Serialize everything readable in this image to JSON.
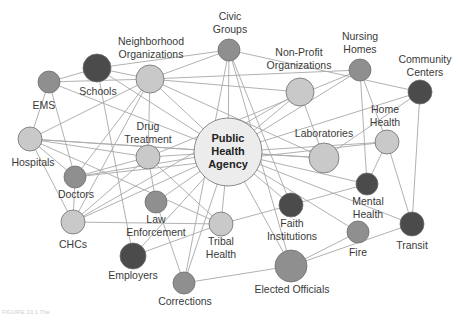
{
  "diagram": {
    "colors": {
      "dark": "#4b4b4b",
      "medium": "#8f8f8f",
      "light": "#c9c9c9",
      "center": "#ececec",
      "edge": "#a8a8a8"
    },
    "center": {
      "id": "pha",
      "lines": [
        "Public",
        "Health",
        "Agency"
      ]
    },
    "nodes": [
      {
        "id": "pha",
        "label": "Public Health Agency",
        "x": 228,
        "y": 152,
        "r": 34,
        "shade": "center"
      },
      {
        "id": "civic",
        "label": "Civic Groups",
        "lines": [
          "Civic",
          "Groups"
        ],
        "x": 229,
        "y": 50,
        "r": 11,
        "shade": "medium"
      },
      {
        "id": "neigh",
        "label": "Neighborhood Organizations",
        "lines": [
          "Neighborhood",
          "Organizations"
        ],
        "x": 150,
        "y": 79,
        "r": 14,
        "shade": "light"
      },
      {
        "id": "schools",
        "label": "Schools",
        "lines": [
          "Schools"
        ],
        "x": 97,
        "y": 68,
        "r": 14,
        "shade": "dark"
      },
      {
        "id": "ems",
        "label": "EMS",
        "lines": [
          "EMS"
        ],
        "x": 49,
        "y": 82,
        "r": 11,
        "shade": "medium"
      },
      {
        "id": "hospitals",
        "label": "Hospitals",
        "lines": [
          "Hospitals"
        ],
        "x": 30,
        "y": 139,
        "r": 12,
        "shade": "light"
      },
      {
        "id": "doctors",
        "label": "Doctors",
        "lines": [
          "Doctors"
        ],
        "x": 75,
        "y": 177,
        "r": 11,
        "shade": "medium"
      },
      {
        "id": "drug",
        "label": "Drug Treatment",
        "lines": [
          "Drug",
          "Treatment"
        ],
        "x": 148,
        "y": 157,
        "r": 12,
        "shade": "light"
      },
      {
        "id": "chcs",
        "label": "CHCs",
        "lines": [
          "CHCs"
        ],
        "x": 73,
        "y": 222,
        "r": 12,
        "shade": "light"
      },
      {
        "id": "law",
        "label": "Law Enforcement",
        "lines": [
          "Law",
          "Enforcement"
        ],
        "x": 156,
        "y": 202,
        "r": 11,
        "shade": "medium"
      },
      {
        "id": "employers",
        "label": "Employers",
        "lines": [
          "Employers"
        ],
        "x": 133,
        "y": 256,
        "r": 13,
        "shade": "dark"
      },
      {
        "id": "tribal",
        "label": "Tribal Health",
        "lines": [
          "Tribal",
          "Health"
        ],
        "x": 221,
        "y": 224,
        "r": 12,
        "shade": "light"
      },
      {
        "id": "corrections",
        "label": "Corrections",
        "lines": [
          "Corrections"
        ],
        "x": 184,
        "y": 283,
        "r": 11,
        "shade": "medium"
      },
      {
        "id": "elected",
        "label": "Elected Officials",
        "lines": [
          "Elected Officials"
        ],
        "x": 291,
        "y": 266,
        "r": 16,
        "shade": "medium"
      },
      {
        "id": "faith",
        "label": "Faith Institutions",
        "lines": [
          "Faith",
          "Institutions"
        ],
        "x": 291,
        "y": 205,
        "r": 12,
        "shade": "dark"
      },
      {
        "id": "fire",
        "label": "Fire",
        "lines": [
          "Fire"
        ],
        "x": 358,
        "y": 232,
        "r": 11,
        "shade": "medium"
      },
      {
        "id": "mental",
        "label": "Mental Health",
        "lines": [
          "Mental",
          "Health"
        ],
        "x": 367,
        "y": 184,
        "r": 11,
        "shade": "dark"
      },
      {
        "id": "transit",
        "label": "Transit",
        "lines": [
          "Transit"
        ],
        "x": 412,
        "y": 224,
        "r": 12,
        "shade": "dark"
      },
      {
        "id": "home",
        "label": "Home Health",
        "lines": [
          "Home",
          "Health"
        ],
        "x": 387,
        "y": 142,
        "r": 12,
        "shade": "light"
      },
      {
        "id": "community",
        "label": "Community Centers",
        "lines": [
          "Community",
          "Centers"
        ],
        "x": 420,
        "y": 92,
        "r": 12,
        "shade": "dark"
      },
      {
        "id": "nursing",
        "label": "Nursing Homes",
        "lines": [
          "Nursing",
          "Homes"
        ],
        "x": 360,
        "y": 70,
        "r": 11,
        "shade": "medium"
      },
      {
        "id": "nonprofit",
        "label": "Non-Profit Organizations",
        "lines": [
          "Non-Profit",
          "Organizations"
        ],
        "x": 300,
        "y": 92,
        "r": 14,
        "shade": "light"
      },
      {
        "id": "labs",
        "label": "Laboratories",
        "lines": [
          "Laboratories"
        ],
        "x": 324,
        "y": 158,
        "r": 15,
        "shade": "light"
      }
    ],
    "labels": [
      {
        "node": "civic",
        "lines": [
          "Civic",
          "Groups"
        ],
        "x": 230,
        "y": 20
      },
      {
        "node": "neigh",
        "lines": [
          "Neighborhood",
          "Organizations"
        ],
        "x": 151,
        "y": 45
      },
      {
        "node": "schools",
        "lines": [
          "Schools"
        ],
        "x": 98,
        "y": 95
      },
      {
        "node": "ems",
        "lines": [
          "EMS"
        ],
        "x": 44,
        "y": 109
      },
      {
        "node": "hospitals",
        "lines": [
          "Hospitals"
        ],
        "x": 33,
        "y": 166
      },
      {
        "node": "doctors",
        "lines": [
          "Doctors"
        ],
        "x": 76,
        "y": 198
      },
      {
        "node": "drug",
        "lines": [
          "Drug",
          "Treatment"
        ],
        "x": 148,
        "y": 130
      },
      {
        "node": "chcs",
        "lines": [
          "CHCs"
        ],
        "x": 73,
        "y": 248
      },
      {
        "node": "law",
        "lines": [
          "Law",
          "Enforcement"
        ],
        "x": 156,
        "y": 223
      },
      {
        "node": "employers",
        "lines": [
          "Employers"
        ],
        "x": 133,
        "y": 279
      },
      {
        "node": "tribal",
        "lines": [
          "Tribal",
          "Health"
        ],
        "x": 221,
        "y": 245
      },
      {
        "node": "corrections",
        "lines": [
          "Corrections"
        ],
        "x": 185,
        "y": 305
      },
      {
        "node": "elected",
        "lines": [
          "Elected Officials"
        ],
        "x": 292,
        "y": 293
      },
      {
        "node": "faith",
        "lines": [
          "Faith",
          "Institutions"
        ],
        "x": 292,
        "y": 227
      },
      {
        "node": "fire",
        "lines": [
          "Fire"
        ],
        "x": 358,
        "y": 256
      },
      {
        "node": "mental",
        "lines": [
          "Mental",
          "Health"
        ],
        "x": 368,
        "y": 205
      },
      {
        "node": "transit",
        "lines": [
          "Transit"
        ],
        "x": 412,
        "y": 249
      },
      {
        "node": "home",
        "lines": [
          "Home",
          "Health"
        ],
        "x": 385,
        "y": 113
      },
      {
        "node": "community",
        "lines": [
          "Community",
          "Centers"
        ],
        "x": 425,
        "y": 63
      },
      {
        "node": "nursing",
        "lines": [
          "Nursing",
          "Homes"
        ],
        "x": 360,
        "y": 40
      },
      {
        "node": "nonprofit",
        "lines": [
          "Non-Profit",
          "Organizations"
        ],
        "x": 299,
        "y": 56
      },
      {
        "node": "labs",
        "lines": [
          "Laboratories"
        ],
        "x": 324,
        "y": 137
      }
    ],
    "edges": [
      [
        "pha",
        "civic"
      ],
      [
        "pha",
        "neigh"
      ],
      [
        "pha",
        "schools"
      ],
      [
        "pha",
        "hospitals"
      ],
      [
        "pha",
        "doctors"
      ],
      [
        "pha",
        "drug"
      ],
      [
        "pha",
        "chcs"
      ],
      [
        "pha",
        "law"
      ],
      [
        "pha",
        "employers"
      ],
      [
        "pha",
        "tribal"
      ],
      [
        "pha",
        "corrections"
      ],
      [
        "pha",
        "elected"
      ],
      [
        "pha",
        "faith"
      ],
      [
        "pha",
        "fire"
      ],
      [
        "pha",
        "mental"
      ],
      [
        "pha",
        "transit"
      ],
      [
        "pha",
        "home"
      ],
      [
        "pha",
        "community"
      ],
      [
        "pha",
        "nursing"
      ],
      [
        "pha",
        "nonprofit"
      ],
      [
        "pha",
        "labs"
      ],
      [
        "pha",
        "ems"
      ],
      [
        "schools",
        "ems"
      ],
      [
        "schools",
        "neigh"
      ],
      [
        "schools",
        "civic"
      ],
      [
        "schools",
        "employers"
      ],
      [
        "ems",
        "neigh"
      ],
      [
        "ems",
        "hospitals"
      ],
      [
        "ems",
        "doctors"
      ],
      [
        "neigh",
        "civic"
      ],
      [
        "neigh",
        "nonprofit"
      ],
      [
        "neigh",
        "nursing"
      ],
      [
        "neigh",
        "drug"
      ],
      [
        "neigh",
        "hospitals"
      ],
      [
        "neigh",
        "doctors"
      ],
      [
        "neigh",
        "chcs"
      ],
      [
        "neigh",
        "labs"
      ],
      [
        "hospitals",
        "doctors"
      ],
      [
        "hospitals",
        "chcs"
      ],
      [
        "hospitals",
        "drug"
      ],
      [
        "hospitals",
        "labs"
      ],
      [
        "hospitals",
        "tribal"
      ],
      [
        "doctors",
        "chcs"
      ],
      [
        "doctors",
        "drug"
      ],
      [
        "doctors",
        "home"
      ],
      [
        "chcs",
        "drug"
      ],
      [
        "chcs",
        "tribal"
      ],
      [
        "chcs",
        "nonprofit"
      ],
      [
        "drug",
        "law"
      ],
      [
        "drug",
        "tribal"
      ],
      [
        "law",
        "corrections"
      ],
      [
        "employers",
        "tribal"
      ],
      [
        "corrections",
        "elected"
      ],
      [
        "corrections",
        "civic"
      ],
      [
        "civic",
        "community"
      ],
      [
        "civic",
        "faith"
      ],
      [
        "civic",
        "elected"
      ],
      [
        "nonprofit",
        "labs"
      ],
      [
        "nursing",
        "mental"
      ],
      [
        "nursing",
        "home"
      ],
      [
        "nursing",
        "drug"
      ],
      [
        "community",
        "transit"
      ],
      [
        "community",
        "labs"
      ],
      [
        "home",
        "mental"
      ],
      [
        "home",
        "transit"
      ],
      [
        "mental",
        "faith"
      ],
      [
        "fire",
        "elected"
      ],
      [
        "transit",
        "elected"
      ],
      [
        "faith",
        "tribal"
      ]
    ]
  },
  "caption": {
    "text": "FIGURE 10.1  The"
  }
}
